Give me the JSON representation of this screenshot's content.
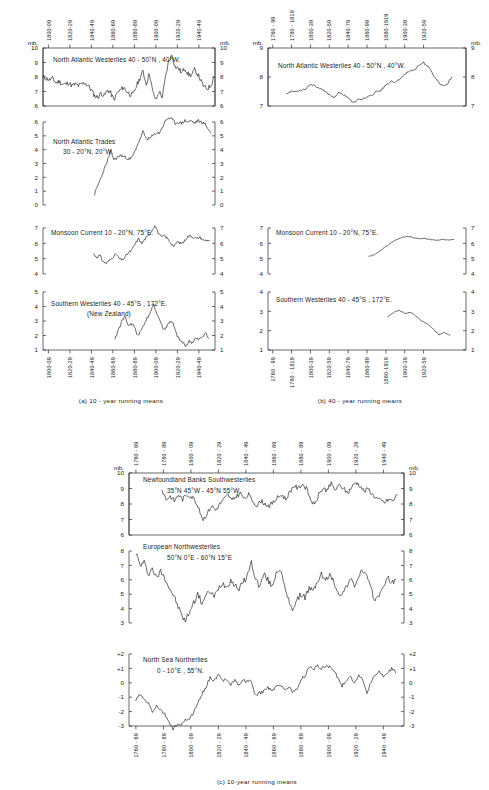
{
  "figure": {
    "units_label": "mb.",
    "captions": {
      "a": "(a)  10 - year  running  means",
      "b": "(b)  40 - year  running  means",
      "c": "(c)  10-year  running  means"
    }
  },
  "chart_data": [
    {
      "id": "a1",
      "type": "line",
      "panel": "a",
      "title": "North Atlantic Westerlies  40 - 50°N , 40°W.",
      "ylabel": "mb.",
      "xlabel": "",
      "ylim": [
        6,
        10
      ],
      "yticks": [
        6,
        7,
        8,
        9,
        10
      ],
      "ytick_labels": [
        "6",
        "7",
        "8",
        "9",
        "10"
      ],
      "xlim": [
        1795,
        1955
      ],
      "xticks": [
        1800,
        1820,
        1840,
        1860,
        1880,
        1900,
        1920,
        1940
      ],
      "xtick_labels": [
        "1800-09",
        "1820-29",
        "1840-49",
        "1860-69",
        "1880-89",
        "1900-09",
        "1920-29",
        "1940-49"
      ],
      "x": [
        1795,
        1798,
        1801,
        1804,
        1807,
        1810,
        1813,
        1816,
        1819,
        1822,
        1825,
        1828,
        1831,
        1834,
        1837,
        1840,
        1843,
        1846,
        1849,
        1852,
        1855,
        1858,
        1861,
        1864,
        1867,
        1870,
        1873,
        1876,
        1879,
        1882,
        1885,
        1888,
        1891,
        1894,
        1897,
        1900,
        1903,
        1906,
        1909,
        1912,
        1915,
        1918,
        1921,
        1924,
        1927,
        1930,
        1933,
        1936,
        1939,
        1942,
        1945,
        1948,
        1951,
        1954
      ],
      "values": [
        8.0,
        7.9,
        7.8,
        7.9,
        7.6,
        7.7,
        7.5,
        7.5,
        7.6,
        7.4,
        7.5,
        7.4,
        7.5,
        7.6,
        7.4,
        7.1,
        6.7,
        6.6,
        6.9,
        6.7,
        7.1,
        6.9,
        6.4,
        6.9,
        7.1,
        7.3,
        7.0,
        6.8,
        6.8,
        7.4,
        7.9,
        8.4,
        7.5,
        8.3,
        7.0,
        6.4,
        7.0,
        6.6,
        8.0,
        9.1,
        9.5,
        8.7,
        8.6,
        8.3,
        8.6,
        8.2,
        8.1,
        8.5,
        8.2,
        7.7,
        7.3,
        7.2,
        7.4,
        8.0
      ]
    },
    {
      "id": "a2",
      "type": "line",
      "panel": "a",
      "title_lines": [
        "North  Atlantic  Trades",
        "30 - 20°N,  20°W."
      ],
      "ylabel": "mb.",
      "ylim": [
        0,
        6
      ],
      "yticks": [
        0,
        1,
        2,
        3,
        4,
        5,
        6
      ],
      "ytick_labels": [
        "0",
        "1",
        "2",
        "3",
        "4",
        "5",
        "6"
      ],
      "xlim": [
        1795,
        1955
      ],
      "x": [
        1843,
        1846,
        1849,
        1852,
        1855,
        1858,
        1861,
        1864,
        1867,
        1870,
        1873,
        1876,
        1879,
        1882,
        1885,
        1888,
        1891,
        1894,
        1897,
        1900,
        1903,
        1906,
        1909,
        1912,
        1915,
        1918,
        1921,
        1924,
        1927,
        1930,
        1933,
        1936,
        1939,
        1942,
        1945,
        1948,
        1951
      ],
      "values": [
        0.8,
        1.4,
        2.0,
        2.6,
        3.2,
        3.9,
        3.3,
        3.4,
        3.6,
        3.5,
        3.4,
        3.3,
        3.6,
        4.2,
        4.7,
        5.3,
        4.8,
        4.8,
        5.0,
        5.2,
        5.2,
        5.6,
        6.1,
        6.3,
        6.2,
        5.9,
        6.0,
        5.9,
        6.1,
        6.0,
        6.1,
        5.9,
        6.1,
        6.0,
        5.9,
        5.6,
        5.2
      ]
    },
    {
      "id": "a3",
      "type": "line",
      "panel": "a",
      "title": "Monsoon Current  10 - 20°N, 75°E.",
      "ylabel": "mb.",
      "ylim": [
        4,
        7
      ],
      "yticks": [
        4,
        5,
        6,
        7
      ],
      "ytick_labels": [
        "4",
        "5",
        "6",
        "7"
      ],
      "xlim": [
        1795,
        1955
      ],
      "x": [
        1842,
        1845,
        1848,
        1851,
        1854,
        1857,
        1860,
        1863,
        1866,
        1869,
        1872,
        1875,
        1878,
        1881,
        1884,
        1887,
        1890,
        1893,
        1896,
        1899,
        1902,
        1905,
        1908,
        1911,
        1914,
        1917,
        1920,
        1923,
        1926,
        1929,
        1932,
        1935,
        1938,
        1941,
        1944,
        1947,
        1950
      ],
      "values": [
        5.3,
        5.1,
        5.2,
        4.8,
        4.7,
        4.9,
        5.1,
        5.3,
        5.0,
        4.9,
        5.2,
        5.4,
        5.6,
        6.0,
        6.3,
        6.0,
        6.3,
        6.5,
        6.8,
        7.2,
        6.7,
        6.4,
        6.5,
        6.3,
        6.0,
        5.8,
        6.1,
        6.0,
        6.1,
        6.4,
        6.5,
        6.4,
        6.3,
        6.4,
        6.2,
        6.2,
        6.2
      ]
    },
    {
      "id": "a4",
      "type": "line",
      "panel": "a",
      "title_lines": [
        "Southern Westerlies 40 - 45°S , 172°E.",
        "(New Zealand)"
      ],
      "ylabel": "mb.",
      "ylim": [
        1,
        5
      ],
      "yticks": [
        1,
        2,
        3,
        4,
        5
      ],
      "ytick_labels": [
        "1",
        "2",
        "3",
        "4",
        "5"
      ],
      "xlim": [
        1795,
        1955
      ],
      "x": [
        1862,
        1865,
        1868,
        1871,
        1874,
        1877,
        1880,
        1883,
        1886,
        1889,
        1892,
        1895,
        1898,
        1901,
        1904,
        1907,
        1910,
        1913,
        1916,
        1919,
        1922,
        1925,
        1928,
        1931,
        1934,
        1937,
        1940,
        1943,
        1946,
        1949
      ],
      "values": [
        1.7,
        2.4,
        2.9,
        3.4,
        2.7,
        2.8,
        2.6,
        2.0,
        2.3,
        2.8,
        3.2,
        3.6,
        4.1,
        3.5,
        3.0,
        2.4,
        2.6,
        3.0,
        2.8,
        2.1,
        1.7,
        1.5,
        1.3,
        1.6,
        1.5,
        1.8,
        1.7,
        1.9,
        2.2,
        1.8
      ]
    },
    {
      "id": "b1",
      "type": "line",
      "panel": "b",
      "title": "North Atlantic Westerlies 40 - 50°N , 40°W.",
      "ylabel": "mb.",
      "ylim": [
        7,
        9
      ],
      "yticks": [
        7,
        8,
        9
      ],
      "ytick_labels": [
        "7",
        "8",
        "9"
      ],
      "xlim": [
        1755,
        1965
      ],
      "xticks": [
        1760,
        1780,
        1800,
        1820,
        1840,
        1860,
        1880,
        1900,
        1920
      ],
      "xtick_labels": [
        "1760 - 99",
        "1780 - 1819",
        "1800-39",
        "1820-59",
        "1840-79",
        "1860-99",
        "1880-1919",
        "1900-39",
        "1920-59"
      ],
      "x": [
        1775,
        1780,
        1785,
        1790,
        1795,
        1800,
        1805,
        1810,
        1815,
        1820,
        1825,
        1830,
        1835,
        1840,
        1845,
        1850,
        1855,
        1860,
        1865,
        1870,
        1875,
        1880,
        1885,
        1890,
        1895,
        1900,
        1905,
        1910,
        1915,
        1920,
        1925,
        1930,
        1935,
        1940,
        1945,
        1950
      ],
      "values": [
        7.45,
        7.5,
        7.5,
        7.55,
        7.6,
        7.75,
        7.7,
        7.6,
        7.5,
        7.4,
        7.3,
        7.45,
        7.4,
        7.3,
        7.1,
        7.2,
        7.25,
        7.3,
        7.35,
        7.5,
        7.55,
        7.7,
        7.85,
        7.8,
        7.95,
        8.1,
        8.2,
        8.25,
        8.4,
        8.5,
        8.35,
        8.1,
        7.85,
        7.7,
        7.75,
        8.0
      ]
    },
    {
      "id": "b2",
      "type": "line",
      "panel": "b",
      "title": "Monsoon Current  10 - 20°N, 75°E.",
      "ylabel": "mb.",
      "ylim": [
        4,
        7
      ],
      "yticks": [
        4,
        5,
        6,
        7
      ],
      "ytick_labels": [
        "4",
        "5",
        "6",
        "7"
      ],
      "xlim": [
        1755,
        1965
      ],
      "x": [
        1862,
        1868,
        1874,
        1880,
        1886,
        1892,
        1898,
        1904,
        1910,
        1916,
        1922,
        1928,
        1934,
        1940,
        1946,
        1952
      ],
      "values": [
        5.15,
        5.25,
        5.5,
        5.8,
        6.05,
        6.25,
        6.4,
        6.45,
        6.35,
        6.3,
        6.3,
        6.25,
        6.2,
        6.25,
        6.2,
        6.25
      ]
    },
    {
      "id": "b3",
      "type": "line",
      "panel": "b",
      "title": "Southern  Westerlies 40 - 45°S , 172°E.",
      "ylabel": "mb.",
      "ylim": [
        1,
        4
      ],
      "yticks": [
        1,
        2,
        3,
        4
      ],
      "ytick_labels": [
        "1",
        "2",
        "3",
        "4"
      ],
      "xlim": [
        1755,
        1965
      ],
      "x": [
        1882,
        1888,
        1894,
        1900,
        1906,
        1912,
        1918,
        1924,
        1930,
        1936,
        1942,
        1948
      ],
      "values": [
        2.75,
        2.95,
        3.05,
        2.9,
        2.95,
        2.75,
        2.5,
        2.35,
        2.1,
        1.8,
        1.9,
        1.75
      ]
    },
    {
      "id": "c1",
      "type": "line",
      "panel": "c",
      "title_lines": [
        "Newfoundland  Banks  Southwesterlies",
        "35°N 45°W - 45°N 55°W."
      ],
      "ylabel": "mb.",
      "ylim": [
        6,
        10
      ],
      "yticks": [
        6,
        7,
        8,
        9,
        10
      ],
      "ytick_labels": [
        "6",
        "7",
        "8",
        "9",
        "10"
      ],
      "xlim": [
        1755,
        1955
      ],
      "xticks": [
        1760,
        1780,
        1800,
        1820,
        1840,
        1860,
        1880,
        1900,
        1920,
        1940
      ],
      "xtick_labels": [
        "1760 - 69",
        "1780 - 89",
        "1800 - 09",
        "1820 - 29",
        "1840 - 49",
        "1860 - 69",
        "1880 - 89",
        "1900 - 09",
        "1920 - 29",
        "1940 - 49"
      ],
      "x": [
        1779,
        1782,
        1785,
        1788,
        1791,
        1794,
        1797,
        1800,
        1803,
        1806,
        1809,
        1812,
        1815,
        1818,
        1821,
        1824,
        1827,
        1830,
        1833,
        1836,
        1839,
        1842,
        1845,
        1848,
        1851,
        1854,
        1857,
        1860,
        1863,
        1866,
        1869,
        1872,
        1875,
        1878,
        1881,
        1884,
        1887,
        1890,
        1893,
        1896,
        1899,
        1902,
        1905,
        1908,
        1911,
        1914,
        1917,
        1920,
        1923,
        1926,
        1929,
        1932,
        1935,
        1938,
        1941,
        1944,
        1947,
        1950
      ],
      "values": [
        8.9,
        8.3,
        8.5,
        8.2,
        8.6,
        8.3,
        8.6,
        8.5,
        8.3,
        7.6,
        7.0,
        7.4,
        7.9,
        7.6,
        8.0,
        8.3,
        8.6,
        8.2,
        8.5,
        8.7,
        8.3,
        8.6,
        8.2,
        7.9,
        8.2,
        8.0,
        7.9,
        8.1,
        8.4,
        8.6,
        8.3,
        8.8,
        9.2,
        9.0,
        9.3,
        9.0,
        8.3,
        7.9,
        8.6,
        9.0,
        8.9,
        9.3,
        8.9,
        9.2,
        9.0,
        8.7,
        9.1,
        9.4,
        9.2,
        8.8,
        9.0,
        8.6,
        8.4,
        8.2,
        8.1,
        8.3,
        8.2,
        8.6
      ]
    },
    {
      "id": "c2",
      "type": "line",
      "panel": "c",
      "title_lines": [
        "European  Northwesterlies",
        "50°N 0°E - 60°N 15°E"
      ],
      "ylabel": "mb.",
      "ylim": [
        3,
        8
      ],
      "yticks": [
        3,
        4,
        5,
        6,
        7,
        8
      ],
      "ytick_labels": [
        "3",
        "4",
        "5",
        "6",
        "7",
        "8"
      ],
      "xlim": [
        1755,
        1955
      ],
      "x": [
        1760,
        1763,
        1766,
        1769,
        1772,
        1775,
        1778,
        1781,
        1784,
        1787,
        1790,
        1793,
        1796,
        1799,
        1802,
        1805,
        1808,
        1811,
        1814,
        1817,
        1820,
        1823,
        1826,
        1829,
        1832,
        1835,
        1838,
        1841,
        1844,
        1847,
        1850,
        1853,
        1856,
        1859,
        1862,
        1865,
        1868,
        1871,
        1874,
        1877,
        1880,
        1883,
        1886,
        1889,
        1892,
        1895,
        1898,
        1901,
        1904,
        1907,
        1910,
        1913,
        1916,
        1919,
        1922,
        1925,
        1928,
        1931,
        1934,
        1937,
        1940,
        1943,
        1946,
        1949
      ],
      "values": [
        7.9,
        7.0,
        7.2,
        6.4,
        6.8,
        6.1,
        6.6,
        6.2,
        5.5,
        5.0,
        4.3,
        3.6,
        3.1,
        3.8,
        4.4,
        5.0,
        4.4,
        4.9,
        5.2,
        4.8,
        5.4,
        5.8,
        5.5,
        6.0,
        5.6,
        5.4,
        5.8,
        6.3,
        7.2,
        6.1,
        5.5,
        6.4,
        6.0,
        5.5,
        6.5,
        6.8,
        5.5,
        4.6,
        4.0,
        4.5,
        5.0,
        4.8,
        5.4,
        5.2,
        5.9,
        6.4,
        5.9,
        6.4,
        5.8,
        5.2,
        4.9,
        5.6,
        6.0,
        5.6,
        6.2,
        6.7,
        6.2,
        5.3,
        4.6,
        5.0,
        5.4,
        6.3,
        5.7,
        6.0
      ]
    },
    {
      "id": "c3",
      "type": "line",
      "panel": "c",
      "title_lines": [
        "North Sea Northerlies",
        "0 - 10°E , 55°N."
      ],
      "ylabel": "",
      "ylim": [
        -3,
        2
      ],
      "yticks": [
        -3,
        -2,
        -1,
        0,
        1,
        2
      ],
      "ytick_labels": [
        "-3",
        "-2",
        "-1",
        "0",
        "+1",
        "+2"
      ],
      "xlim": [
        1755,
        1955
      ],
      "x": [
        1760,
        1763,
        1766,
        1769,
        1772,
        1775,
        1778,
        1781,
        1784,
        1787,
        1790,
        1793,
        1796,
        1799,
        1802,
        1805,
        1808,
        1811,
        1814,
        1817,
        1820,
        1823,
        1826,
        1829,
        1832,
        1835,
        1838,
        1841,
        1844,
        1847,
        1850,
        1853,
        1856,
        1859,
        1862,
        1865,
        1868,
        1871,
        1874,
        1877,
        1880,
        1883,
        1886,
        1889,
        1892,
        1895,
        1898,
        1901,
        1904,
        1907,
        1910,
        1913,
        1916,
        1919,
        1922,
        1925,
        1928,
        1931,
        1934,
        1937,
        1940,
        1943,
        1946,
        1949
      ],
      "values": [
        -1.2,
        -0.8,
        -1.2,
        -1.4,
        -2.0,
        -1.6,
        -1.9,
        -2.2,
        -2.7,
        -3.2,
        -2.9,
        -3.0,
        -2.5,
        -2.6,
        -2.0,
        -1.4,
        -0.8,
        -0.3,
        0.4,
        0.1,
        0.6,
        0.1,
        0.3,
        -0.1,
        0.2,
        -0.2,
        0.2,
        0.1,
        0.1,
        -0.9,
        -0.7,
        -0.6,
        -0.3,
        -0.6,
        -0.2,
        -0.1,
        -0.5,
        -0.3,
        -0.6,
        -0.5,
        0.2,
        0.5,
        1.1,
        0.9,
        1.2,
        1.0,
        1.2,
        1.1,
        0.9,
        0.3,
        -0.2,
        0.1,
        0.5,
        -0.1,
        0.6,
        0.2,
        -0.7,
        0.1,
        0.5,
        0.8,
        0.4,
        0.6,
        1.0,
        0.7
      ]
    }
  ]
}
